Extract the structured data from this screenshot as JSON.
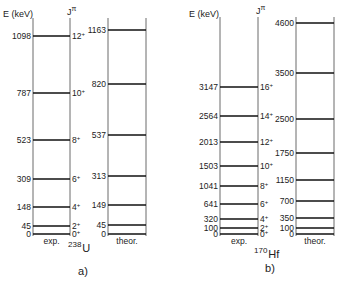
{
  "chart_data": [
    {
      "type": "level-scheme",
      "panel": "a)",
      "nucleus": {
        "mass": "238",
        "symbol": "U"
      },
      "ylabel": "E (keV)",
      "spin_label": "Jπ",
      "columns": [
        {
          "name": "exp.",
          "levels": [
            {
              "energy": 0,
              "label": "0",
              "spin": "0+",
              "y": 234
            },
            {
              "energy": 45,
              "label": "45",
              "spin": "2+",
              "y": 226
            },
            {
              "energy": 148,
              "label": "148",
              "spin": "4+",
              "y": 207
            },
            {
              "energy": 309,
              "label": "309",
              "spin": "6+",
              "y": 179
            },
            {
              "energy": 523,
              "label": "523",
              "spin": "8+",
              "y": 140
            },
            {
              "energy": 787,
              "label": "787",
              "spin": "10+",
              "y": 93
            },
            {
              "energy": 1098,
              "label": "1098",
              "spin": "12+",
              "y": 36
            }
          ]
        },
        {
          "name": "theor.",
          "levels": [
            {
              "energy": 0,
              "label": "0",
              "y": 234
            },
            {
              "energy": 45,
              "label": "45",
              "y": 225
            },
            {
              "energy": 149,
              "label": "149",
              "y": 205
            },
            {
              "energy": 313,
              "label": "313",
              "y": 176
            },
            {
              "energy": 537,
              "label": "537",
              "y": 135
            },
            {
              "energy": 820,
              "label": "820",
              "y": 84
            },
            {
              "energy": 1163,
              "label": "1163",
              "y": 30
            }
          ]
        }
      ]
    },
    {
      "type": "level-scheme",
      "panel": "b)",
      "nucleus": {
        "mass": "170",
        "symbol": "Hf"
      },
      "ylabel": "E (keV)",
      "spin_label": "Jπ",
      "columns": [
        {
          "name": "exp.",
          "levels": [
            {
              "energy": 0,
              "label": "0",
              "spin": "0+",
              "y": 234
            },
            {
              "energy": 100,
              "label": "100",
              "spin": "2+",
              "y": 228
            },
            {
              "energy": 320,
              "label": "320",
              "spin": "4+",
              "y": 219
            },
            {
              "energy": 641,
              "label": "641",
              "spin": "6+",
              "y": 204
            },
            {
              "energy": 1041,
              "label": "1041",
              "spin": "8+",
              "y": 186
            },
            {
              "energy": 1503,
              "label": "1503",
              "spin": "10+",
              "y": 166
            },
            {
              "energy": 2013,
              "label": "2013",
              "spin": "12+",
              "y": 142
            },
            {
              "energy": 2564,
              "label": "2564",
              "spin": "14+",
              "y": 116
            },
            {
              "energy": 3147,
              "label": "3147",
              "spin": "16+",
              "y": 87
            }
          ]
        },
        {
          "name": "theor.",
          "levels": [
            {
              "energy": 0,
              "label": "0",
              "y": 234
            },
            {
              "energy": 100,
              "label": "100",
              "y": 228
            },
            {
              "energy": 350,
              "label": "350",
              "y": 218
            },
            {
              "energy": 700,
              "label": "700",
              "y": 201
            },
            {
              "energy": 1150,
              "label": "1150",
              "y": 180
            },
            {
              "energy": 1750,
              "label": "1750",
              "y": 153
            },
            {
              "energy": 2500,
              "label": "2500",
              "y": 119
            },
            {
              "energy": 3500,
              "label": "3500",
              "y": 73
            },
            {
              "energy": 4600,
              "label": "4600",
              "y": 23
            }
          ]
        }
      ]
    }
  ],
  "layout": {
    "panels": [
      {
        "exp_x": [
          33,
          70
        ],
        "theor_x": [
          108,
          146
        ],
        "top": 18,
        "bottom": 235,
        "ylabel_pos": [
          3,
          17
        ],
        "spin_label_pos": [
          67,
          15
        ],
        "nucleus_pos": [
          68,
          252
        ],
        "caption_pos": [
          83,
          275
        ]
      },
      {
        "exp_x": [
          220,
          258
        ],
        "theor_x": [
          296,
          334
        ],
        "top": 17,
        "bottom": 235,
        "ylabel_pos": [
          189,
          17
        ],
        "spin_label_pos": [
          256,
          14
        ],
        "nucleus_pos": [
          254,
          258
        ],
        "caption_pos": [
          270,
          272
        ]
      }
    ]
  }
}
